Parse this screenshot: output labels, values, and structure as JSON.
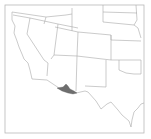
{
  "map": {
    "region_shown": "Southwestern United States",
    "highlighted_region": "Southern Arizona border area",
    "colors": {
      "background": "#ffffff",
      "frame": "#b8b8b8",
      "borders": "#a8a8a8",
      "highlight": "#6e6e6e"
    }
  }
}
